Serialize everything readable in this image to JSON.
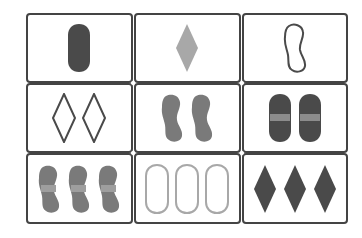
{
  "game": {
    "name": "Set card grid",
    "rows": 3,
    "cols": 3
  },
  "colors": {
    "dark": "#4a4a4a",
    "medium": "#7a7a7a",
    "light": "#a8a8a8",
    "border": "#444444",
    "background": "#ffffff",
    "stripe_band_dark": "#8c8c8c",
    "stripe_band_medium": "#9e9e9e"
  },
  "cards": [
    {
      "row": 0,
      "col": 0,
      "count": 1,
      "shape": "oval",
      "shading": "solid",
      "color": "dark"
    },
    {
      "row": 0,
      "col": 1,
      "count": 1,
      "shape": "diamond",
      "shading": "solid",
      "color": "light"
    },
    {
      "row": 0,
      "col": 2,
      "count": 1,
      "shape": "squiggle",
      "shading": "outlined",
      "color": "dark"
    },
    {
      "row": 1,
      "col": 0,
      "count": 2,
      "shape": "diamond",
      "shading": "outlined",
      "color": "dark"
    },
    {
      "row": 1,
      "col": 1,
      "count": 2,
      "shape": "squiggle",
      "shading": "solid",
      "color": "medium"
    },
    {
      "row": 1,
      "col": 2,
      "count": 2,
      "shape": "oval",
      "shading": "striped",
      "color": "dark"
    },
    {
      "row": 2,
      "col": 0,
      "count": 3,
      "shape": "squiggle",
      "shading": "striped",
      "color": "medium"
    },
    {
      "row": 2,
      "col": 1,
      "count": 3,
      "shape": "oval",
      "shading": "outlined",
      "color": "light"
    },
    {
      "row": 2,
      "col": 2,
      "count": 3,
      "shape": "diamond",
      "shading": "solid",
      "color": "dark"
    }
  ]
}
